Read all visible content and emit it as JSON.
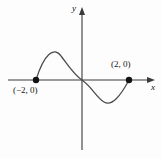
{
  "figure": {
    "kind": "coordinate-plane-graph",
    "background_color": "#fdfdfd",
    "ink_color": "#3a3a3a",
    "text_color": "#151515"
  },
  "axes": {
    "x_label": "x",
    "y_label": "y",
    "x_axis_pixel_y": 80,
    "y_axis_pixel_x": 82,
    "x_axis_from": 8,
    "x_axis_to": 152,
    "y_axis_from": 150,
    "y_axis_to": 10,
    "arrowheads": [
      "x-positive",
      "y-positive"
    ],
    "grid": false,
    "tick_labels": []
  },
  "labels": {
    "left_point": "(−2, 0)",
    "right_point": "(2, 0)"
  },
  "chart_data": {
    "type": "line",
    "title": "",
    "xlabel": "x",
    "ylabel": "y",
    "grid": false,
    "legend": "none",
    "xlim": [
      -3.2,
      3.2
    ],
    "ylim": [
      -2.2,
      2.2
    ],
    "series": [
      {
        "name": "cubic curve through (-2,0), (0,0), (2,0)",
        "description": "S-shaped cubic crossing the x-axis at x = -2, x = 0 and x = 2; local maximum between -2 and 0, local minimum between 0 and 2",
        "x": [
          -2.0,
          -1.7,
          -1.45,
          -1.15,
          -0.85,
          -0.5,
          -0.2,
          0.0,
          0.25,
          0.6,
          0.95,
          1.25,
          1.55,
          1.8,
          2.0
        ],
        "y": [
          0.0,
          0.46,
          0.72,
          0.92,
          0.98,
          0.82,
          0.38,
          0.0,
          -0.42,
          -0.86,
          -1.04,
          -1.0,
          -0.78,
          -0.48,
          0.0
        ],
        "path_d": "M 36 80 C 44 54 54 46 61 56 C 68 65 74 75 82 80 C 91 86 97 98 104 102 C 112 107 121 95 129 80"
      }
    ],
    "points": [
      {
        "label": "(−2, 0)",
        "x": -2,
        "y": 0,
        "pixel_x": 36,
        "pixel_y": 80,
        "marker": "filled-circle"
      },
      {
        "label": "(2, 0)",
        "x": 2,
        "y": 0,
        "pixel_x": 129,
        "pixel_y": 80,
        "marker": "filled-circle"
      }
    ],
    "annotations": [
      {
        "text": "(−2, 0)",
        "attached_to": "left-root",
        "position": "below"
      },
      {
        "text": "(2, 0)",
        "attached_to": "right-root",
        "position": "above"
      }
    ]
  }
}
